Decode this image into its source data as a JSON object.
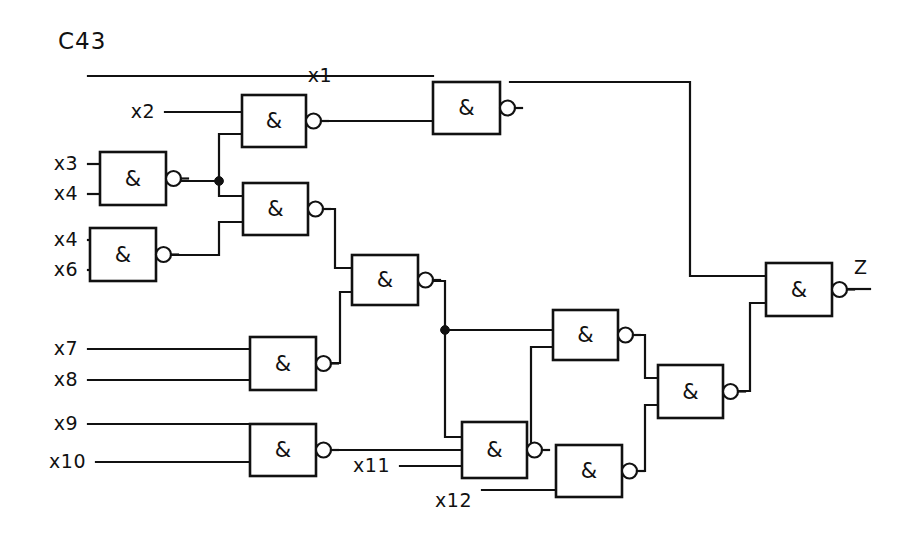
{
  "figure": {
    "title": "C43",
    "title_pos": [
      58,
      42
    ],
    "width": 904,
    "height": 545,
    "background": "#ffffff",
    "line_color": "#111111"
  },
  "chart_data": {
    "type": "diagram",
    "diagram_kind": "logic-circuit-schematic",
    "title": "C43",
    "gate_symbol": "&",
    "gate_type": "NAND",
    "primary_inputs": [
      "x1",
      "x2",
      "x3",
      "x4",
      "x4",
      "x6",
      "x7",
      "x8",
      "x9",
      "x10",
      "x11",
      "x12"
    ],
    "primary_outputs": [
      "Z"
    ],
    "gate_count": 12,
    "gates": [
      {
        "id": "g1",
        "label": "&",
        "box": [
          242,
          95,
          64,
          52
        ],
        "inputs": [
          "x2",
          "g2"
        ],
        "output_to": "g3"
      },
      {
        "id": "g2",
        "label": "&",
        "box": [
          100,
          152,
          66,
          53
        ],
        "inputs": [
          "x3",
          "x4"
        ],
        "output_to": "g1,g4"
      },
      {
        "id": "g3",
        "label": "&",
        "box": [
          433,
          82,
          67,
          52
        ],
        "inputs": [
          "x1",
          "g1"
        ],
        "output_to": "g12"
      },
      {
        "id": "g4",
        "label": "&",
        "box": [
          243,
          183,
          65,
          52
        ],
        "inputs": [
          "g2",
          "g5"
        ],
        "output_to": "g6"
      },
      {
        "id": "g5",
        "label": "&",
        "box": [
          90,
          228,
          66,
          53
        ],
        "inputs": [
          "x4",
          "x6"
        ],
        "output_to": "g4"
      },
      {
        "id": "g6",
        "label": "&",
        "box": [
          352,
          255,
          66,
          50
        ],
        "inputs": [
          "g4",
          "g7"
        ],
        "output_to": "g8,g10"
      },
      {
        "id": "g7",
        "label": "&",
        "box": [
          250,
          337,
          66,
          53
        ],
        "inputs": [
          "x7",
          "x8"
        ],
        "output_to": "g6"
      },
      {
        "id": "g8",
        "label": "&",
        "box": [
          553,
          310,
          65,
          50
        ],
        "inputs": [
          "g6",
          "g9"
        ],
        "output_to": "g11"
      },
      {
        "id": "g9",
        "label": "&",
        "box": [
          250,
          424,
          66,
          52
        ],
        "inputs": [
          "x9",
          "x10"
        ],
        "output_to": "g8"
      },
      {
        "id": "g10",
        "label": "&",
        "box": [
          462,
          422,
          65,
          56
        ],
        "inputs": [
          "g6",
          "x11"
        ],
        "output_to": "g11_lower"
      },
      {
        "id": "g11",
        "label": "&",
        "box": [
          556,
          445,
          66,
          52
        ],
        "inputs": [
          "g10",
          "x12"
        ],
        "output_to": "g11b"
      },
      {
        "id": "g11b",
        "label": "&",
        "box": [
          658,
          365,
          65,
          53
        ],
        "inputs": [
          "g8",
          "g11"
        ],
        "output_to": "g12"
      },
      {
        "id": "g12",
        "label": "&",
        "box": [
          766,
          263,
          66,
          53
        ],
        "inputs": [
          "g3",
          "g11b"
        ],
        "output_to": "Z"
      }
    ],
    "input_labels": [
      {
        "text": "x1",
        "x": 332,
        "y": 76,
        "align": "end"
      },
      {
        "text": "x2",
        "x": 155,
        "y": 112,
        "align": "end"
      },
      {
        "text": "x3",
        "x": 78,
        "y": 164,
        "align": "end"
      },
      {
        "text": "x4",
        "x": 78,
        "y": 194,
        "align": "end"
      },
      {
        "text": "x4",
        "x": 78,
        "y": 240,
        "align": "end"
      },
      {
        "text": "x6",
        "x": 78,
        "y": 270,
        "align": "end"
      },
      {
        "text": "x7",
        "x": 78,
        "y": 349,
        "align": "end"
      },
      {
        "text": "x8",
        "x": 78,
        "y": 380,
        "align": "end"
      },
      {
        "text": "x9",
        "x": 78,
        "y": 424,
        "align": "end"
      },
      {
        "text": "x10",
        "x": 86,
        "y": 462,
        "align": "end"
      },
      {
        "text": "x11",
        "x": 390,
        "y": 466,
        "align": "end"
      },
      {
        "text": "x12",
        "x": 472,
        "y": 501,
        "align": "end"
      }
    ],
    "output_labels": [
      {
        "text": "Z",
        "x": 854,
        "y": 268,
        "align": "start"
      }
    ]
  },
  "wires": {
    "paths": [
      "M 88 76 L 433 76",
      "M 165 112 L 242 112",
      "M 88 164 L 100 164",
      "M 88 194 L 100 194",
      "M 88 240 L 90 240",
      "M 88 270 L 90 270",
      "M 88 349 L 250 349",
      "M 88 380 L 250 380",
      "M 88 424 L 250 424",
      "M 96 462 L 250 462",
      "M 400 466 L 462 466",
      "M 482 490 L 556 490",
      "M 176 181 L 219 181",
      "M 219 181 L 219 134 L 242 134",
      "M 219 181 L 219 196 L 243 196",
      "M 166 255 L 219 255 L 219 222 L 243 222",
      "M 316 121 L 433 121",
      "M 318 209 L 335 209 L 335 268 L 352 268",
      "M 326 363 L 340 363 L 340 292 L 352 292",
      "M 428 281 L 445 281 L 445 330 L 553 330",
      "M 445 330 L 445 437 L 462 437",
      "M 326 450 L 445 450 L 445 450",
      "M 326 450 L 531 450 L 531 347 L 553 347",
      "M 510 82 L 690 82 L 690 276 L 766 276",
      "M 628 335 L 645 335 L 645 378 L 658 378",
      "M 632 471 L 645 471 L 645 405 L 658 405",
      "M 733 391 L 750 391 L 750 303 L 766 303",
      "M 842 289 L 870 289"
    ]
  },
  "junctions": [
    {
      "x": 219,
      "y": 181,
      "r": 4.4
    },
    {
      "x": 445,
      "y": 330,
      "r": 4.4
    }
  ]
}
